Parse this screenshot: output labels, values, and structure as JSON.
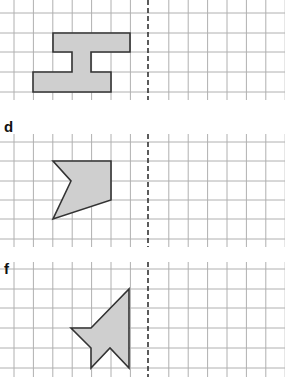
{
  "colors": {
    "grid": "#b0b0b0",
    "mirror_line": "#333333",
    "shape_fill": "#cfcfcf",
    "shape_stroke": "#333333"
  },
  "grid": {
    "x_lines": [
      14,
      33.4,
      52.8,
      72.2,
      91.6,
      111,
      130.4,
      168.8,
      188.2,
      207.6,
      227,
      246.4,
      265.8,
      285.2
    ],
    "mirror_x": 148
  },
  "panels": [
    {
      "label": "",
      "y_lines": [
        13,
        33,
        52,
        72,
        92
      ],
      "y_range": [
        0,
        100
      ],
      "shape_points": "53,33 130,33 130,52 91,52 91,72 111,72 111,92 33,92 33,72 72,72 72,52 53,52"
    },
    {
      "label": "d",
      "label_pos": [
        4,
        120
      ],
      "y_lines": [
        142,
        161,
        181,
        200,
        219,
        239
      ],
      "y_range": [
        134,
        247
      ],
      "shape_points": "53,161 111,161 111,200 53,219 71,181"
    },
    {
      "label": "f",
      "label_pos": [
        4,
        262
      ],
      "y_lines": [
        269,
        289,
        308,
        328,
        348,
        368
      ],
      "y_range": [
        262,
        377
      ],
      "shape_points": "129,289 129,368 110,348 91,368 91,348 71,328 91,328"
    }
  ]
}
